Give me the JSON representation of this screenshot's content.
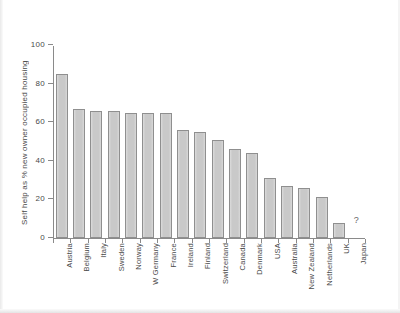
{
  "chart_data": {
    "type": "bar",
    "title": "",
    "xlabel": "",
    "ylabel": "Self help as % new owner occupied housing",
    "ylim": [
      0,
      100
    ],
    "yticks": [
      0,
      20,
      40,
      60,
      80,
      100
    ],
    "grid": false,
    "legend": null,
    "categories": [
      "Austria",
      "Belgium",
      "Italy",
      "Sweden",
      "Norway",
      "W Germany",
      "France",
      "Ireland",
      "Finland",
      "Switzerland",
      "Canada",
      "Denmark",
      "USA",
      "Australia",
      "New Zealand",
      "Netherlands",
      "UK",
      "Japan"
    ],
    "values": [
      85,
      67,
      66,
      66,
      65,
      65,
      65,
      56,
      55,
      51,
      46,
      44,
      31,
      27,
      26,
      21,
      8,
      null
    ],
    "annotations": [
      {
        "text": "?",
        "category": "Japan",
        "note": "no data for Japan"
      }
    ]
  }
}
